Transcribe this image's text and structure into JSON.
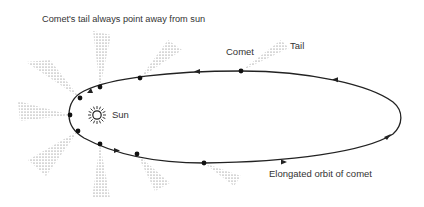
{
  "diagram": {
    "title": "Comet's tail always point away from sun",
    "labels": {
      "sun": "Sun",
      "comet": "Comet",
      "tail": "Tail",
      "orbit": "Elongated orbit of comet"
    },
    "colors": {
      "line": "#222222",
      "text": "#333333",
      "tail_dots": "#555555",
      "background": "#ffffff"
    },
    "sun": {
      "x": 97,
      "y": 115
    },
    "comet_positions": [
      {
        "x": 241,
        "y": 71,
        "tail_tip": [
          285,
          44
        ]
      },
      {
        "x": 140,
        "y": 78,
        "tail_tip": [
          176,
          45
        ]
      },
      {
        "x": 100,
        "y": 87,
        "tail_tip": [
          102,
          33
        ]
      },
      {
        "x": 80,
        "y": 98,
        "tail_tip": [
          38,
          63
        ]
      },
      {
        "x": 70,
        "y": 115,
        "tail_tip": [
          20,
          110
        ]
      },
      {
        "x": 78,
        "y": 131,
        "tail_tip": [
          37,
          168
        ]
      },
      {
        "x": 100,
        "y": 144,
        "tail_tip": [
          100,
          198
        ]
      },
      {
        "x": 137,
        "y": 154,
        "tail_tip": [
          162,
          187
        ]
      },
      {
        "x": 204,
        "y": 163,
        "tail_tip": [
          238,
          181
        ]
      }
    ],
    "direction_arrows": [
      {
        "x": 336,
        "y": 80,
        "direction": "left"
      },
      {
        "x": 197,
        "y": 71,
        "direction": "left"
      },
      {
        "x": 90,
        "y": 92,
        "direction": "down-left"
      },
      {
        "x": 116,
        "y": 150,
        "direction": "right"
      },
      {
        "x": 283,
        "y": 162,
        "direction": "right"
      },
      {
        "x": 388,
        "y": 137,
        "direction": "up-right"
      }
    ]
  }
}
